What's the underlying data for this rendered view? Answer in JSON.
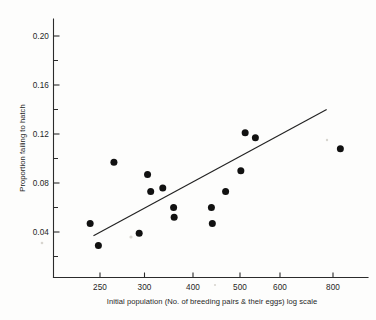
{
  "chart_data": {
    "type": "scatter",
    "title": "",
    "xlabel": "Initial population (No. of breeding pairs & their eggs) log scale",
    "ylabel": "Proportion failing to hatch",
    "xscale": "log",
    "yscale": "linear",
    "xlim": [
      215,
      900
    ],
    "ylim": [
      0.0,
      0.215
    ],
    "grid": false,
    "legend": false,
    "xticks": [
      250,
      300,
      400,
      500,
      600,
      800
    ],
    "xtick_labels": [
      "250",
      "300",
      "400",
      "500",
      "600",
      "800"
    ],
    "yticks": [
      0.04,
      0.08,
      0.12,
      0.16,
      0.2
    ],
    "ytick_labels": [
      "0.04",
      "0.08",
      "0.12",
      "0.16",
      "0.20"
    ],
    "yticks_minor": [
      0.02,
      0.06,
      0.1,
      0.14,
      0.18
    ],
    "points": [
      {
        "x": 238,
        "y": 0.047
      },
      {
        "x": 248,
        "y": 0.029
      },
      {
        "x": 268,
        "y": 0.097
      },
      {
        "x": 304,
        "y": 0.039
      },
      {
        "x": 317,
        "y": 0.087
      },
      {
        "x": 322,
        "y": 0.073
      },
      {
        "x": 342,
        "y": 0.076
      },
      {
        "x": 361,
        "y": 0.06
      },
      {
        "x": 362,
        "y": 0.052
      },
      {
        "x": 436,
        "y": 0.06
      },
      {
        "x": 438,
        "y": 0.047
      },
      {
        "x": 468,
        "y": 0.073
      },
      {
        "x": 505,
        "y": 0.09
      },
      {
        "x": 516,
        "y": 0.121
      },
      {
        "x": 543,
        "y": 0.117
      },
      {
        "x": 830,
        "y": 0.108
      }
    ],
    "trend_line": {
      "x_start": 242,
      "y_start": 0.037,
      "x_end": 775,
      "y_end": 0.14
    }
  },
  "annotations": {
    "y_axis_label": "Proportion failing to hatch",
    "x_axis_label": "Initial population (No. of breeding pairs & their eggs) log scale"
  }
}
